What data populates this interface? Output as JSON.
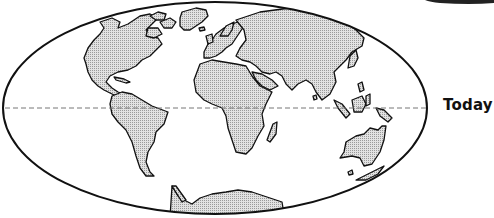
{
  "figure": {
    "type": "world-map-projection",
    "projection": "elliptical (Mollweide-style)",
    "label": "Today",
    "equator_style": "dashed",
    "land_fill": "stippled light gray",
    "colors": {
      "outline": "#111111",
      "land": "#d4d4d4",
      "equator": "#777777",
      "background": "#ffffff"
    },
    "continents": [
      "North America",
      "Greenland",
      "South America",
      "Europe",
      "Africa",
      "Madagascar",
      "Asia",
      "Southeast Asia islands",
      "Australia",
      "New Zealand",
      "Antarctica"
    ]
  }
}
